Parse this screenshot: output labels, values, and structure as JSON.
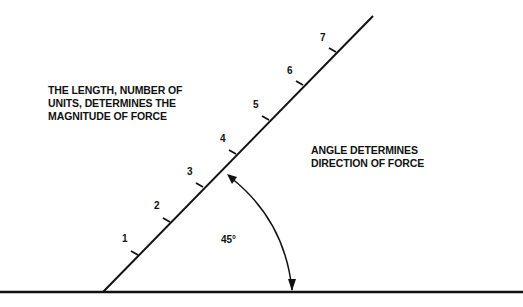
{
  "labels": {
    "magnitude_line1": "THE LENGTH, NUMBER OF",
    "magnitude_line2": "UNITS, DETERMINES THE",
    "magnitude_line3": "MAGNITUDE OF FORCE",
    "direction_line1": "ANGLE DETERMINES",
    "direction_line2": "DIRECTION OF FORCE",
    "angle": "45°"
  },
  "ticks": [
    "1",
    "2",
    "3",
    "4",
    "5",
    "6",
    "7"
  ],
  "colors": {
    "ink": "#111111",
    "background": "#ffffff"
  }
}
